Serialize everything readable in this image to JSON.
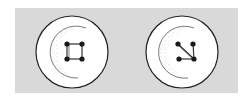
{
  "figure": {
    "colors": {
      "page": "#ffffff",
      "fabric": "#d9d9d9",
      "button_fill": "#ffffff",
      "outline": "#222222",
      "holes": "#1a1a1a",
      "stipple": "#8a8a8a"
    },
    "buttons": [
      {
        "name": "square-stitch-button",
        "cx": 72,
        "cy": 52,
        "r": 36,
        "stitch": "square"
      },
      {
        "name": "cross-stitch-button",
        "cx": 182,
        "cy": 52,
        "r": 36,
        "stitch": "z"
      }
    ]
  }
}
